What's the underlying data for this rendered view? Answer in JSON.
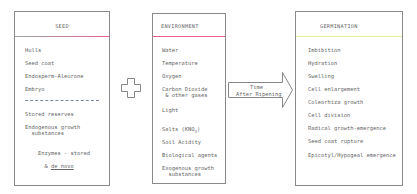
{
  "seed": {
    "title": "SEED",
    "items": [
      "Hulls",
      "Seed coat",
      "Endosperm-Aleurone",
      "Embryo"
    ],
    "items_below": [
      "Stored reserves",
      "Endogenous growth\n  substances",
      "Enzymes - stored"
    ],
    "enzymes_line2_prefix": "& ",
    "enzymes_line2_underlined": "de novo",
    "separator_color": "#e8628a"
  },
  "plus_symbol": "plus",
  "environment": {
    "title": "ENVIRONMENT",
    "items": [
      "Water",
      "Temperature",
      "Oxygen",
      "Carbon Dioxide\n & other gases",
      "Light"
    ],
    "salts_prefix": "Salts (KNO",
    "salts_sub": "3",
    "salts_suffix": ")",
    "items_after": [
      "Soil Acidity",
      "Biological agents",
      "Exogenous growth\n  substances"
    ],
    "separator_color": "#e8628a"
  },
  "arrow": {
    "line1": "Time",
    "line2": "After Ripening"
  },
  "germination": {
    "title": "GERMINATION",
    "items": [
      "Imbibition",
      "Hydration",
      "Swelling",
      "Cell enlargement",
      "Coleorhiza growth",
      "Cell division",
      "Radical growth-emergence",
      "Seed coat rupture",
      "Epicotyl/Hypogeal emergence"
    ],
    "separator_color": "#e6ee9a"
  }
}
